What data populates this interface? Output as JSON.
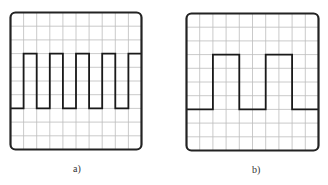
{
  "figure": {
    "panels": [
      {
        "id": "a",
        "label": "a)",
        "box": {
          "x": 9,
          "y": 11,
          "w": 134,
          "h": 140
        },
        "grid": {
          "cols": 10,
          "rows": 10
        },
        "waveform": {
          "type": "square",
          "high_row": 3,
          "low_row": 7,
          "points": [
            [
              0,
              7
            ],
            [
              1,
              7
            ],
            [
              1,
              3
            ],
            [
              2,
              3
            ],
            [
              2,
              7
            ],
            [
              3,
              7
            ],
            [
              3,
              3
            ],
            [
              4,
              3
            ],
            [
              4,
              7
            ],
            [
              5,
              7
            ],
            [
              5,
              3
            ],
            [
              6,
              3
            ],
            [
              6,
              7
            ],
            [
              7,
              7
            ],
            [
              7,
              3
            ],
            [
              8,
              3
            ],
            [
              8,
              7
            ],
            [
              9,
              7
            ],
            [
              9,
              3
            ],
            [
              10,
              3
            ]
          ]
        },
        "label_pos": {
          "x": 73,
          "y": 163
        }
      },
      {
        "id": "b",
        "label": "b)",
        "box": {
          "x": 185,
          "y": 12,
          "w": 135,
          "h": 140
        },
        "grid": {
          "cols": 10,
          "rows": 10
        },
        "waveform": {
          "type": "square",
          "high_row": 3,
          "low_row": 7,
          "points": [
            [
              0,
              7
            ],
            [
              2,
              7
            ],
            [
              2,
              3
            ],
            [
              4,
              3
            ],
            [
              4,
              7
            ],
            [
              6,
              7
            ],
            [
              6,
              3
            ],
            [
              8,
              3
            ],
            [
              8,
              7
            ],
            [
              10,
              7
            ]
          ]
        },
        "label_pos": {
          "x": 252,
          "y": 164
        }
      }
    ],
    "colors": {
      "frame": "#222222",
      "grid": "#bdbdbd",
      "trace": "#1a1a1a",
      "background": "#ffffff"
    }
  }
}
